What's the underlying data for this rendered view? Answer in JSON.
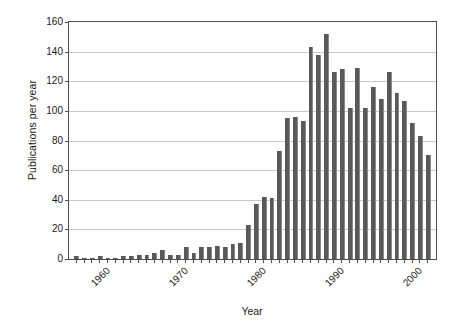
{
  "chart_data": {
    "type": "bar",
    "title": "",
    "xlabel": "Year",
    "ylabel": "Publications per year",
    "ylim": [
      0,
      160
    ],
    "ytick_step": 20,
    "yticks": [
      0,
      20,
      40,
      60,
      80,
      100,
      120,
      140,
      160
    ],
    "xlim": [
      1959,
      2006
    ],
    "xtick_labels": [
      "1960",
      "1970",
      "1980",
      "1990",
      "2000"
    ],
    "xticks": [
      1960,
      1970,
      1980,
      1990,
      2000
    ],
    "grid": true,
    "legend": null,
    "bar_color": "#595959",
    "grid_color": "#c8c8c8",
    "axis_color": "#4d4d4d",
    "background": "#ffffff",
    "categories": [
      1960,
      1961,
      1962,
      1963,
      1964,
      1965,
      1966,
      1967,
      1968,
      1969,
      1970,
      1971,
      1972,
      1973,
      1974,
      1975,
      1976,
      1977,
      1978,
      1979,
      1980,
      1981,
      1982,
      1983,
      1984,
      1985,
      1986,
      1987,
      1988,
      1989,
      1990,
      1991,
      1992,
      1993,
      1994,
      1995,
      1996,
      1997,
      1998,
      1999,
      2000,
      2001,
      2002,
      2003,
      2004,
      2005
    ],
    "values": [
      2,
      1,
      1,
      2,
      1,
      1,
      2,
      2,
      3,
      3,
      4,
      6,
      3,
      3,
      8,
      4,
      8,
      8,
      9,
      8,
      10,
      11,
      23,
      37,
      42,
      41,
      73,
      95,
      96,
      93,
      143,
      138,
      152,
      126,
      128,
      102,
      129,
      102,
      116,
      108,
      126,
      112,
      107,
      92,
      83,
      70
    ]
  }
}
